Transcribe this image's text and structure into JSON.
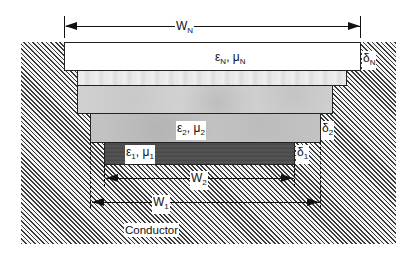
{
  "diagram": {
    "dimensions": {
      "wN": {
        "letter": "W",
        "sub": "N"
      },
      "w2": {
        "letter": "W",
        "sub": "2"
      },
      "w1": {
        "letter": "W",
        "sub": "1"
      }
    },
    "layers": [
      {
        "id": "N",
        "eps": "ε",
        "eps_sub": "N",
        "mu": "μ",
        "mu_sub": "N",
        "sep": ", ",
        "thickness": {
          "letter": "δ",
          "sub": "N"
        },
        "fill": "#ffffff"
      },
      {
        "id": "intermediate-upper",
        "fill": "#e8e8e8"
      },
      {
        "id": "intermediate-lower",
        "fill": "#d0d0d0"
      },
      {
        "id": "2",
        "eps": "ε",
        "eps_sub": "2",
        "mu": "μ",
        "mu_sub": "2",
        "sep": ", ",
        "thickness": {
          "letter": "δ",
          "sub": "2"
        },
        "fill": "#c2c2c2"
      },
      {
        "id": "1",
        "eps": "ε",
        "eps_sub": "1",
        "mu": "μ",
        "mu_sub": "1",
        "sep": ", ",
        "thickness": {
          "letter": "δ",
          "sub": "1"
        },
        "fill": "#4d4d4d"
      }
    ],
    "substrate": {
      "label": "Conductor",
      "pattern": "diagonal-hatch"
    }
  }
}
